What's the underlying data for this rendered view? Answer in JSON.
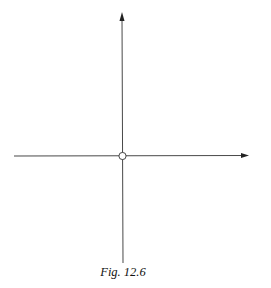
{
  "figure": {
    "caption": "Fig. 12.6",
    "colors": {
      "stroke": "#333333",
      "background": "#ffffff",
      "point_fill": "#ffffff"
    },
    "axes": {
      "horizontal": {
        "x1": 14,
        "y": 156,
        "x2": 248,
        "arrow": "right"
      },
      "vertical": {
        "x": 122,
        "y1": 263,
        "y2": 12,
        "arrow": "up"
      }
    },
    "origin_point": {
      "type": "open-circle",
      "cx": 122,
      "cy": 156,
      "r": 3.5
    }
  }
}
